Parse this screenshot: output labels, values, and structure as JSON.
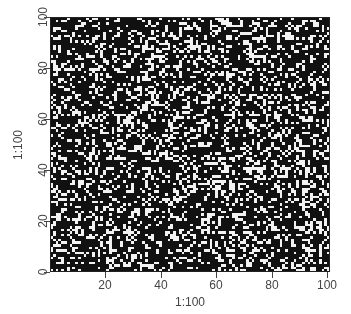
{
  "chart_data": {
    "type": "heatmap",
    "title": "",
    "xlabel": "1:100",
    "ylabel": "1:100",
    "x_ticks": [
      "20",
      "40",
      "60",
      "80",
      "100"
    ],
    "y_ticks": [
      "0",
      "20",
      "40",
      "60",
      "80",
      "100"
    ],
    "xlim": [
      0.5,
      100.5
    ],
    "ylim": [
      0,
      100
    ],
    "grid": false,
    "legend": "none",
    "matrix_size": [
      100,
      100
    ],
    "values_description": "random binary matrix (0 = black, 1 = white)",
    "fill_fraction_white": 0.28,
    "colors": {
      "zero": "#111111",
      "one": "#f2f2f2"
    }
  },
  "axes": {
    "x_title": "1:100",
    "y_title": "1:100",
    "x_tick_labels": [
      "20",
      "40",
      "60",
      "80",
      "100"
    ],
    "y_tick_labels": [
      "0",
      "20",
      "40",
      "60",
      "80",
      "100"
    ]
  }
}
